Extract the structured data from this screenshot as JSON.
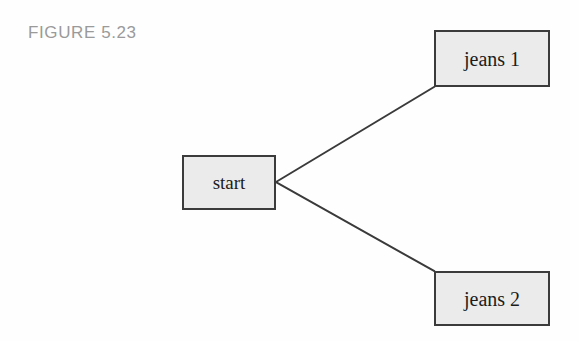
{
  "figure": {
    "caption": "FIGURE 5.23",
    "caption_color": "#9a9a9a",
    "background_color": "#fefefe"
  },
  "diagram": {
    "type": "tree",
    "node_fill_color": "#ebebeb",
    "node_border_color": "#3b3b3b",
    "edge_color": "#3a3a3a",
    "nodes": [
      {
        "id": "start",
        "label": "start",
        "x": 182,
        "y": 155,
        "width": 94,
        "height": 55
      },
      {
        "id": "jeans-1",
        "label": "jeans 1",
        "x": 434,
        "y": 30,
        "width": 116,
        "height": 57
      },
      {
        "id": "jeans-2",
        "label": "jeans 2",
        "x": 434,
        "y": 271,
        "width": 116,
        "height": 55
      }
    ],
    "edges": [
      {
        "from": "start",
        "to": "jeans-1",
        "x1": 276,
        "y1": 182,
        "x2": 434,
        "y2": 87
      },
      {
        "from": "start",
        "to": "jeans-2",
        "x1": 276,
        "y1": 182,
        "x2": 434,
        "y2": 271
      }
    ]
  }
}
